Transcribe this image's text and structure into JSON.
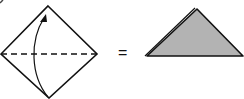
{
  "diagram": {
    "equals_sign": "=",
    "steps": [
      {
        "name": "square-diamond",
        "description": "Square rotated 45° with dashed horizontal fold line and curved arrow from bottom corner to top corner"
      },
      {
        "name": "result-triangle",
        "description": "Resulting folded triangle, shaded gray"
      }
    ],
    "colors": {
      "stroke": "#111111",
      "fill": "#b3b3b3",
      "background": "#ffffff"
    }
  }
}
